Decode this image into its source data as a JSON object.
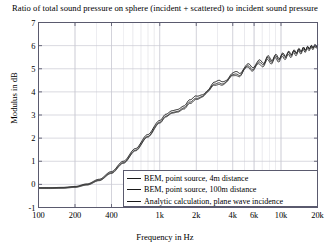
{
  "chart_data": {
    "type": "line",
    "title": "Ratio of total sound pressure on sphere (incident + scattered) to incident sound pressure",
    "xlabel": "Frequency in Hz",
    "ylabel": "Modulus in dB",
    "xscale": "log",
    "xlim": [
      100,
      20000
    ],
    "ylim": [
      -1,
      7
    ],
    "yticks": [
      -1,
      0,
      1,
      2,
      3,
      4,
      5,
      6,
      7
    ],
    "ytick_labels": [
      "-1",
      "0",
      "1",
      "2",
      "3",
      "4",
      "5",
      "6",
      "7"
    ],
    "xticks": [
      100,
      200,
      400,
      1000,
      2000,
      4000,
      6000,
      10000,
      20000
    ],
    "xtick_labels": [
      "100",
      "200",
      "400",
      "1k",
      "2k",
      "4k",
      "6k",
      "10k",
      "20k"
    ],
    "grid": true,
    "legend_position": "lower right",
    "series": [
      {
        "name": "BEM, point source, 4m distance",
        "color": "#141414",
        "x": [
          100,
          126,
          158,
          200,
          251,
          316,
          398,
          501,
          631,
          794,
          1000,
          1122,
          1259,
          1413,
          1585,
          1778,
          2000,
          2239,
          2512,
          2818,
          3162,
          3548,
          3981,
          4467,
          5012,
          5623,
          6310,
          7079,
          7943,
          8913,
          10000,
          11220,
          12589,
          14125,
          15849,
          17783,
          20000
        ],
        "y": [
          -0.14,
          -0.14,
          -0.13,
          -0.09,
          0.02,
          0.22,
          0.55,
          1.0,
          1.55,
          2.15,
          2.78,
          3.05,
          3.18,
          3.2,
          3.32,
          3.62,
          3.88,
          3.98,
          4.08,
          4.3,
          4.5,
          4.6,
          4.7,
          4.88,
          5.05,
          5.13,
          5.22,
          5.35,
          5.45,
          5.5,
          5.56,
          5.65,
          5.72,
          5.8,
          5.88,
          5.95,
          6.02
        ]
      },
      {
        "name": "BEM, point source, 100m distance",
        "color": "#262626",
        "x": [
          100,
          126,
          158,
          200,
          251,
          316,
          398,
          501,
          631,
          794,
          1000,
          1122,
          1259,
          1413,
          1585,
          1778,
          2000,
          2239,
          2512,
          2818,
          3162,
          3548,
          3981,
          4467,
          5012,
          5623,
          6310,
          7079,
          7943,
          8913,
          10000,
          11220,
          12589,
          14125,
          15849,
          17783,
          20000
        ],
        "y": [
          -0.16,
          -0.16,
          -0.15,
          -0.11,
          -0.01,
          0.18,
          0.5,
          0.94,
          1.48,
          2.07,
          2.7,
          2.96,
          3.09,
          3.11,
          3.24,
          3.54,
          3.8,
          3.9,
          4.0,
          4.22,
          4.42,
          4.52,
          4.62,
          4.8,
          4.97,
          5.05,
          5.14,
          5.28,
          5.38,
          5.44,
          5.5,
          5.6,
          5.68,
          5.77,
          5.85,
          5.93,
          6.0
        ]
      },
      {
        "name": "Analytic calculation, plane wave incidence",
        "color": "#3a3a3a",
        "x": [
          100,
          126,
          158,
          200,
          251,
          316,
          398,
          501,
          631,
          794,
          1000,
          1122,
          1259,
          1413,
          1585,
          1778,
          2000,
          2239,
          2512,
          2818,
          3162,
          3548,
          3981,
          4467,
          5012,
          5623,
          6310,
          7079,
          7943,
          8913,
          10000,
          11220,
          12589,
          14125,
          15849,
          17783,
          20000
        ],
        "y": [
          -0.18,
          -0.18,
          -0.17,
          -0.13,
          -0.03,
          0.16,
          0.47,
          0.91,
          1.45,
          2.04,
          2.66,
          2.92,
          3.05,
          3.07,
          3.2,
          3.5,
          3.76,
          3.86,
          3.96,
          4.18,
          4.38,
          4.48,
          4.58,
          4.76,
          4.93,
          5.0,
          5.08,
          5.2,
          5.3,
          5.36,
          5.42,
          5.52,
          5.6,
          5.7,
          5.78,
          5.87,
          5.95
        ]
      }
    ],
    "ripple": {
      "description": "small periodic oscillation superimposed on curves above 1 kHz",
      "amplitude_db": 0.12
    }
  },
  "legend": {
    "entries": [
      "BEM, point source, 4m distance",
      "BEM, point source, 100m distance",
      "Analytic calculation, plane wave incidence"
    ]
  },
  "colors": {
    "axis": "#5a5a6e",
    "grid": "#c8c8d2",
    "curve": "#141414",
    "background": "#ffffff"
  }
}
